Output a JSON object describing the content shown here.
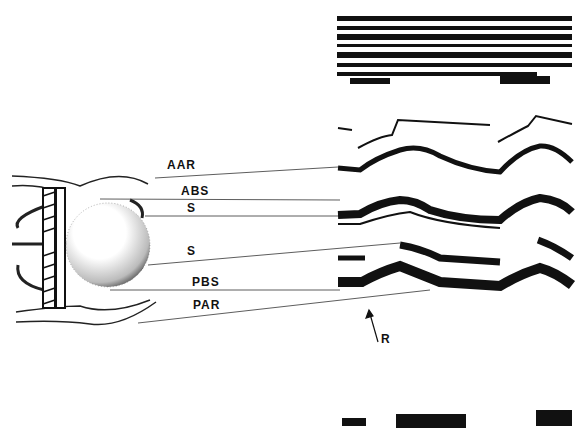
{
  "figure": {
    "type": "M-mode echocardiogram of ball-valve prosthesis with schematic",
    "labels": [
      {
        "id": "aar",
        "text": "AAR",
        "x": 170,
        "y": 163
      },
      {
        "id": "abs",
        "text": "ABS",
        "x": 182,
        "y": 185
      },
      {
        "id": "s1",
        "text": "S",
        "x": 188,
        "y": 203
      },
      {
        "id": "s2",
        "text": "S",
        "x": 188,
        "y": 246
      },
      {
        "id": "pbs",
        "text": "PBS",
        "x": 192,
        "y": 278
      },
      {
        "id": "par",
        "text": "PAR",
        "x": 194,
        "y": 300
      },
      {
        "id": "r",
        "text": "R",
        "x": 381,
        "y": 333
      }
    ]
  }
}
